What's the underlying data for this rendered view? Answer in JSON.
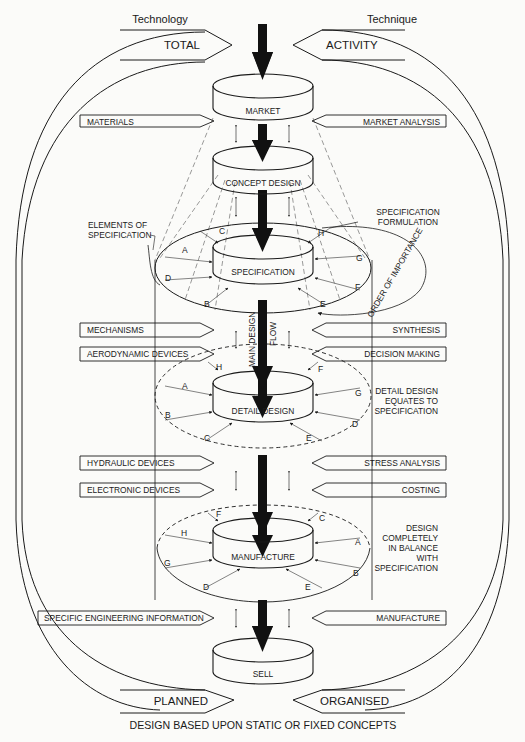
{
  "header": {
    "left_title": "Technology",
    "right_title": "Technique"
  },
  "outer_arrows": {
    "top_left": "TOTAL",
    "top_right": "ACTIVITY",
    "bottom_left": "PLANNED",
    "bottom_right": "ORGANISED"
  },
  "stages": [
    {
      "id": "market",
      "label": "MARKET"
    },
    {
      "id": "concept",
      "label": "CONCEPT DESIGN"
    },
    {
      "id": "specification",
      "label": "SPECIFICATION"
    },
    {
      "id": "detail",
      "label": "DETAIL DESIGN"
    },
    {
      "id": "manufacture",
      "label": "MANUFACTURE"
    },
    {
      "id": "sell",
      "label": "SELL"
    }
  ],
  "left_inputs": [
    "MATERIALS",
    "MECHANISMS",
    "AERODYNAMIC DEVICES",
    "HYDRAULIC DEVICES",
    "ELECTRONIC DEVICES",
    "SPECIFIC ENGINEERING INFORMATION"
  ],
  "right_inputs": [
    "MARKET ANALYSIS",
    "SYNTHESIS",
    "DECISION MAKING",
    "STRESS ANALYSIS",
    "COSTING",
    "MANUFACTURE"
  ],
  "annotations": {
    "elements_of_spec": [
      "ELEMENTS OF",
      "SPECIFICATION"
    ],
    "spec_formulation": [
      "SPECIFICATION",
      "FORMULATION"
    ],
    "order_of_importance": "ORDER OF IMPORTANCE",
    "main_flow_1": "MAIN DESIGN",
    "main_flow_2": "FLOW",
    "detail_equates": [
      "DETAIL DESIGN",
      "EQUATES TO",
      "SPECIFICATION"
    ],
    "design_balance": [
      "DESIGN",
      "COMPLETELY",
      "IN BALANCE",
      "WITH",
      "SPECIFICATION"
    ]
  },
  "ring_letters": {
    "specification": [
      "C",
      "A",
      "D",
      "B",
      "H",
      "G",
      "F",
      "E"
    ],
    "detail": [
      "H",
      "A",
      "B",
      "C",
      "F",
      "G",
      "D",
      "E"
    ],
    "manufacture": [
      "F",
      "H",
      "G",
      "D",
      "C",
      "A",
      "B",
      "E"
    ]
  },
  "caption": "DESIGN BASED UPON STATIC OR FIXED CONCEPTS",
  "colors": {
    "ink": "#1a1a1a",
    "paper": "#fbfbf9"
  }
}
